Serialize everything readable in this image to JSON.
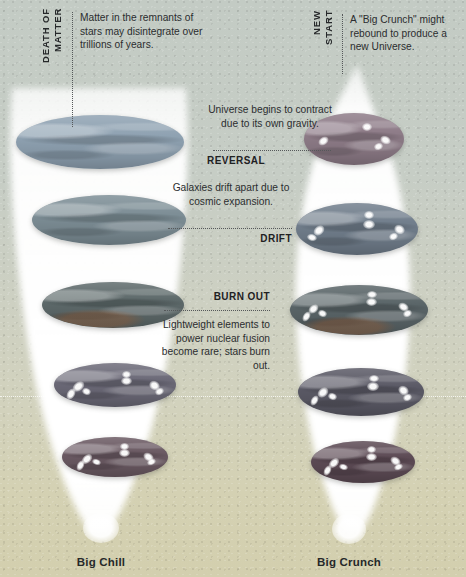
{
  "figure": {
    "background_top_color": "#c3cbc4",
    "background_bottom_color": "#d3cfae"
  },
  "left_branch": {
    "caption": "Big Chill",
    "vertical_label": "DEATH OF\nMATTER",
    "vertical_label_line1": "DEATH OF",
    "vertical_label_line2": "MATTER",
    "note": "Matter in the remnants of stars may disintegrate over trillions of years."
  },
  "right_branch": {
    "caption": "Big Crunch",
    "vertical_label_line1": "NEW",
    "vertical_label_line2": "START",
    "note": "A \"Big Crunch\" might rebound to produce a new Universe."
  },
  "stages": [
    {
      "id": "reversal",
      "kicker": "REVERSAL",
      "note": "Universe begins to contract due to its own gravity."
    },
    {
      "id": "drift",
      "kicker": "DRIFT",
      "note": "Galaxies drift apart due to cosmic expansion."
    },
    {
      "id": "burn-out",
      "kicker": "BURN OUT",
      "note": "Lightweight elements to power nuclear fusion become rare; stars burn out."
    }
  ],
  "discs": {
    "left": [
      {
        "name": "disc-left-1",
        "color": "#8fa2b2"
      },
      {
        "name": "disc-left-2",
        "color": "#7d8e96"
      },
      {
        "name": "disc-left-3",
        "color": "#5e6a6b"
      },
      {
        "name": "disc-left-4",
        "color": "#6c6a78"
      },
      {
        "name": "disc-left-5",
        "color": "#6b5a63"
      }
    ],
    "right": [
      {
        "name": "disc-right-1",
        "color": "#8e7c88"
      },
      {
        "name": "disc-right-2",
        "color": "#717e8c"
      },
      {
        "name": "disc-right-3",
        "color": "#5a6568"
      },
      {
        "name": "disc-right-4",
        "color": "#5b5a66"
      },
      {
        "name": "disc-right-5",
        "color": "#5d4b55"
      }
    ]
  }
}
